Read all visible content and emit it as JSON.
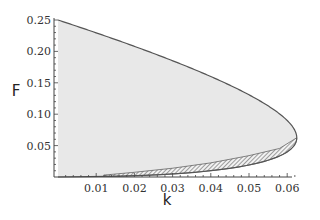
{
  "chart_data": {
    "type": "area",
    "title": "",
    "xlabel": "k",
    "ylabel": "F",
    "xlim": [
      0,
      0.063
    ],
    "ylim": [
      0,
      0.25
    ],
    "x_ticks": [
      0.01,
      0.02,
      0.03,
      0.04,
      0.05,
      0.06
    ],
    "x_tick_labels": [
      "0.01",
      "0.02",
      "0.03",
      "0.04",
      "0.05",
      "0.06"
    ],
    "y_ticks": [
      0.05,
      0.1,
      0.15,
      0.2,
      0.25
    ],
    "y_tick_labels": [
      "0.05",
      "0.10",
      "0.15",
      "0.20",
      "0.25"
    ],
    "grid": false,
    "legend": null,
    "series": [
      {
        "name": "saddle-node boundary",
        "relation": "k = sqrt(F)/2 - F",
        "points_k_F": [
          [
            0,
            0.25
          ],
          [
            0.01,
            0.2297
          ],
          [
            0.02,
            0.208
          ],
          [
            0.03,
            0.1841
          ],
          [
            0.04,
            0.1567
          ],
          [
            0.05,
            0.1207
          ],
          [
            0.0625,
            0.0625
          ],
          [
            0.05,
            0.0293
          ],
          [
            0.04,
            0.0193
          ],
          [
            0.03,
            0.0123
          ],
          [
            0.02,
            0.0069
          ],
          [
            0.01,
            0.0029
          ],
          [
            0,
            0
          ]
        ],
        "fill": "#e8e8e8",
        "stroke": "#555555"
      },
      {
        "name": "hatched band (lower branch)",
        "k_range": [
          0.012,
          0.0625
        ],
        "points_k_F": [
          [
            0.012,
            0.003
          ],
          [
            0.02,
            0.0075
          ],
          [
            0.03,
            0.014
          ],
          [
            0.04,
            0.0225
          ],
          [
            0.05,
            0.034
          ],
          [
            0.058,
            0.0455
          ],
          [
            0.0625,
            0.0625
          ]
        ],
        "style": "hatched"
      }
    ]
  },
  "axes": {
    "xlabel": "k",
    "ylabel": "F"
  },
  "colors": {
    "fill": "#e8e8e8",
    "curve": "#555555",
    "axis": "#444444",
    "text": "#333333"
  }
}
